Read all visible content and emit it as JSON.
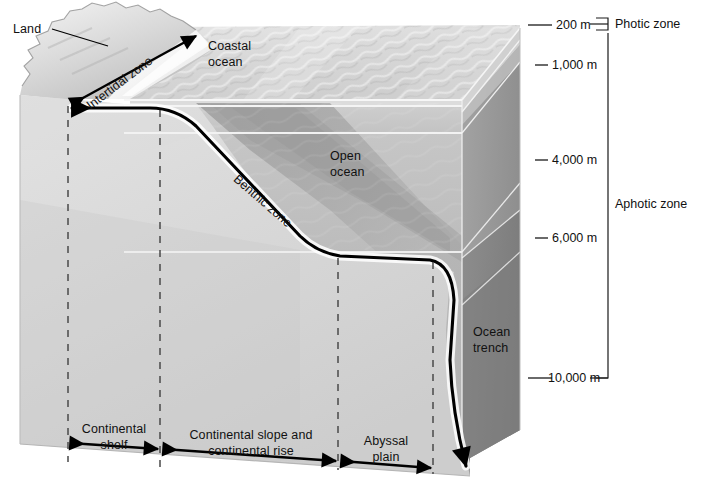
{
  "figure": {
    "type": "diagram"
  },
  "labels": {
    "land": "Land",
    "intertidal_zone": "Intertidal zone",
    "coastal_ocean_line1": "Coastal",
    "coastal_ocean_line2": "ocean",
    "open_ocean_line1": "Open",
    "open_ocean_line2": "ocean",
    "benthic_zone": "Benthic zone",
    "ocean_trench_line1": "Ocean",
    "ocean_trench_line2": "trench"
  },
  "depth_scale": {
    "unit": "m",
    "ticks": [
      {
        "label": "200 m",
        "value": 200,
        "y": 25
      },
      {
        "label": "1,000 m",
        "value": 1000,
        "y": 65
      },
      {
        "label": "4,000 m",
        "value": 4000,
        "y": 160
      },
      {
        "label": "6,000 m",
        "value": 6000,
        "y": 238
      },
      {
        "label": "10,000 m",
        "value": 10000,
        "y": 378
      }
    ]
  },
  "light_zones": [
    {
      "name": "Photic zone",
      "top_y": 18,
      "bottom_y": 34
    },
    {
      "name": "Aphotic zone",
      "top_y": 34,
      "bottom_y": 380
    }
  ],
  "seafloor_provinces": [
    {
      "label_line1": "Continental",
      "label_line2": "shelf",
      "left_x": 68,
      "right_x": 160
    },
    {
      "label_line1": "Continental slope and",
      "label_line2": "continental rise",
      "left_x": 160,
      "right_x": 338
    },
    {
      "label_line1": "Abyssal",
      "label_line2": "plain",
      "left_x": 338,
      "right_x": 433
    }
  ],
  "colors": {
    "block_front": "#d2d2d2",
    "block_right": "#9b9b9b",
    "block_right_dark": "#8a8a8a",
    "water_upper": "#c9c9c9",
    "water_mid": "#b3b3b3",
    "water_deep": "#a0a0a0",
    "land": "#cfcfcf",
    "line": "#000000",
    "dashed": "#555555",
    "white_edge": "#f2f2f2"
  }
}
